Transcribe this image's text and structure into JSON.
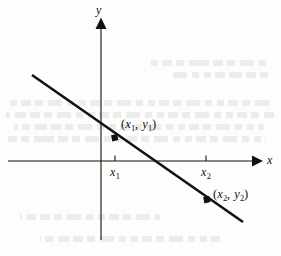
{
  "figure": {
    "type": "coordinate-plane-line-diagram",
    "background_color": "#fdfdfc",
    "ink_color": "#111111"
  },
  "axes": {
    "x_axis_label": "x",
    "y_axis_label": "y",
    "origin_px": [
      101,
      161
    ],
    "x_axis_span_px": [
      8,
      262
    ],
    "y_axis_span_px": [
      18,
      240
    ],
    "arrowheads": [
      "x-positive",
      "y-positive"
    ]
  },
  "ticks": [
    {
      "name": "x1",
      "label_base": "x",
      "label_sub": "1",
      "x_px": 115
    },
    {
      "name": "x2",
      "label_base": "x",
      "label_sub": "2",
      "x_px": 206
    }
  ],
  "points": [
    {
      "name": "point-1",
      "label_open": "(",
      "label_x_base": "x",
      "label_x_sub": "1",
      "label_comma": ", ",
      "label_y_base": "y",
      "label_y_sub": "1",
      "label_close": ")",
      "label_text": "(x1, y1)",
      "marker_px": [
        115,
        138
      ],
      "label_px": [
        122,
        118
      ]
    },
    {
      "name": "point-2",
      "label_open": "(",
      "label_x_base": "x",
      "label_x_sub": "2",
      "label_comma": ", ",
      "label_y_base": "y",
      "label_y_sub": "2",
      "label_close": ")",
      "label_text": "(x2, y2)",
      "marker_px": [
        207,
        200
      ],
      "label_px": [
        214,
        188
      ]
    }
  ],
  "line": {
    "name": "secant-line",
    "start_px": [
      32,
      75
    ],
    "end_px": [
      243,
      222
    ],
    "slope_px": -0.697,
    "x_intercept_px": 155,
    "stroke_width": 2.6
  },
  "chart_data": {
    "type": "line",
    "title": "",
    "xlabel": "x",
    "ylabel": "y",
    "grid": false,
    "legend": null,
    "series": [
      {
        "name": "line through (x1, y1) and (x2, y2)",
        "x": [
          -98.9,
          2.0,
          14.0,
          105.0,
          141.0
        ],
        "y": [
          86.0,
          15.4,
          7.0,
          -56.6,
          -81.0
        ],
        "annotated_points": [
          {
            "label": "(x1, y1)",
            "x": 14.0,
            "y": 23.0
          },
          {
            "label": "(x2, y2)",
            "x": 105.0,
            "y": -39.0
          }
        ]
      }
    ],
    "xticks": [
      {
        "value": 14.0,
        "label": "x1"
      },
      {
        "value": 105.0,
        "label": "x2"
      }
    ],
    "yticks": [],
    "xlim": [
      -93,
      161
    ],
    "ylim": [
      -79,
      143
    ]
  },
  "ghost_text": {
    "description": "faint bleed-through text from reverse side of scanned page",
    "rows": [
      {
        "top": 100,
        "left": 10,
        "width": 262
      },
      {
        "top": 112,
        "left": 6,
        "width": 268
      },
      {
        "top": 124,
        "left": 14,
        "width": 250
      },
      {
        "top": 136,
        "left": 8,
        "width": 258
      },
      {
        "top": 60,
        "left": 150,
        "width": 120
      },
      {
        "top": 72,
        "left": 170,
        "width": 100
      },
      {
        "top": 214,
        "left": 20,
        "width": 140
      },
      {
        "top": 236,
        "left": 40,
        "width": 180
      }
    ]
  }
}
